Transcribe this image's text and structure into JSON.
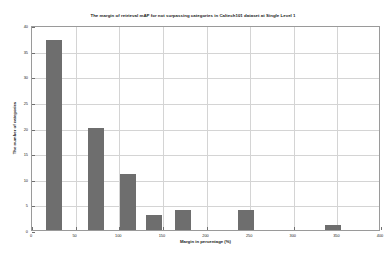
{
  "chart_data": {
    "type": "bar",
    "title": "The margin of retrieval mAP for not surpassing categories in Caltech101 dataset at Single Level 1",
    "xlabel": "Margin in percentage (%)",
    "ylabel": "The number of categories",
    "xlim": [
      0,
      400
    ],
    "ylim": [
      0,
      40
    ],
    "grid": true,
    "legend": "none",
    "xticks": [
      0,
      50,
      100,
      150,
      200,
      250,
      300,
      350,
      400
    ],
    "xticklabels": [
      "0",
      "50",
      "100",
      "150",
      "200",
      "250",
      "300",
      "350",
      "400"
    ],
    "yticks": [
      0,
      5,
      10,
      15,
      20,
      25,
      30,
      35,
      40
    ],
    "yticklabels": [
      "0",
      "5",
      "10",
      "15",
      "20",
      "25",
      "30",
      "35",
      "40"
    ],
    "bar_color": "#6e6e6e",
    "bar_width": 18,
    "x": [
      25,
      73,
      110,
      140,
      173,
      245,
      345
    ],
    "values": [
      37,
      20,
      11,
      3,
      4,
      4,
      1
    ]
  }
}
